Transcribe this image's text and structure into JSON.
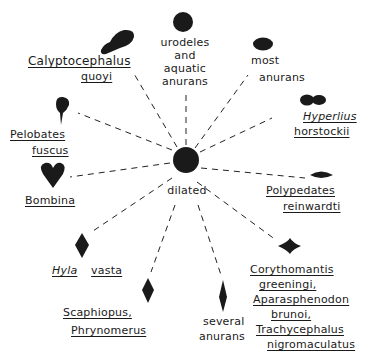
{
  "diagram": {
    "type": "radial",
    "center": {
      "label": "dilated",
      "shape": "circle"
    },
    "color": "#1a1a1a",
    "spokes": [
      {
        "id": "urodeles",
        "lines": [
          "urodeles",
          "and",
          "aquatic",
          "anurans"
        ],
        "underlined": false,
        "shape": "circle"
      },
      {
        "id": "most-anurans",
        "lines": [
          "most",
          "anurans"
        ],
        "underlined": false,
        "shape": "horizontal-oval"
      },
      {
        "id": "hyperlius",
        "lines": [
          "Hyperlius",
          "horstockii"
        ],
        "underlined": true,
        "shape": "bilobed-oval"
      },
      {
        "id": "polypedates",
        "lines": [
          "Polypedates",
          "reinwardti"
        ],
        "underlined": true,
        "shape": "narrow-horizontal-lens"
      },
      {
        "id": "corythomantis",
        "lines": [
          "Corythomantis",
          "greeningi,",
          "Aparasphenodon",
          "brunoi,",
          "Trachycephalus",
          "nigromaculatus"
        ],
        "underlined": true,
        "shape": "horizontal-diamond"
      },
      {
        "id": "several-anurans",
        "lines": [
          "several",
          "anurans"
        ],
        "underlined": false,
        "shape": "tall-narrow-diamond"
      },
      {
        "id": "scaphiopus",
        "lines": [
          "Scaphiopus,",
          "Phrynomerus"
        ],
        "underlined": true,
        "shape": "vertical-diamond"
      },
      {
        "id": "hyla",
        "lines": [
          "Hyla",
          "vasta"
        ],
        "underlined": true,
        "shape": "vertical-diamond"
      },
      {
        "id": "bombina",
        "lines": [
          "Bombina"
        ],
        "underlined": true,
        "shape": "heart"
      },
      {
        "id": "pelobates",
        "lines": [
          "Pelobates",
          "fuscus"
        ],
        "underlined": true,
        "shape": "inverted-teardrop"
      },
      {
        "id": "calyptocephalus",
        "lines": [
          "Calyptocephalus",
          "quoyi"
        ],
        "underlined": true,
        "shape": "tilted-teardrop"
      }
    ]
  }
}
